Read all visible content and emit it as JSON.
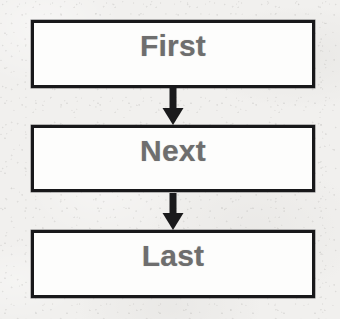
{
  "document": {
    "type": "flowchart",
    "title": "Sequence flowchart",
    "orientation": "vertical",
    "background_color": "#f1f0ee",
    "box_fill_color": "#fdfdfc",
    "box_border_color": "#18181a",
    "text_color": "#6e6e6e",
    "arrow_color": "#1a1a1c"
  },
  "flow": {
    "nodes": [
      {
        "id": "node-first",
        "label": "First",
        "order": 1
      },
      {
        "id": "node-next",
        "label": "Next",
        "order": 2
      },
      {
        "id": "node-last",
        "label": "Last",
        "order": 3
      }
    ],
    "connectors": [
      {
        "id": "connector-first-next",
        "from": "First",
        "to": "Next",
        "direction": "down",
        "icon": "arrow-down-icon"
      },
      {
        "id": "connector-next-last",
        "from": "Next",
        "to": "Last",
        "direction": "down",
        "icon": "arrow-down-icon"
      }
    ]
  }
}
